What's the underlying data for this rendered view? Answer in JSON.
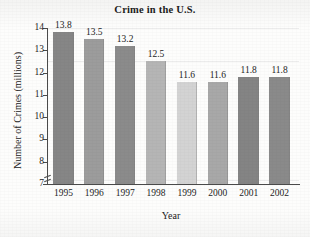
{
  "chart_data": {
    "type": "bar",
    "title": "Crime in the U.S.",
    "xlabel": "Year",
    "ylabel": "Number of Crimes (millions)",
    "categories": [
      "1995",
      "1996",
      "1997",
      "1998",
      "1999",
      "2000",
      "2001",
      "2002"
    ],
    "values": [
      13.8,
      13.5,
      13.2,
      12.5,
      11.6,
      11.6,
      11.8,
      11.8
    ],
    "value_labels": [
      "13.8",
      "13.5",
      "13.2",
      "12.5",
      "11.6",
      "11.6",
      "11.8",
      "11.8"
    ],
    "ylim": [
      7,
      14
    ],
    "yticks": [
      7,
      8,
      9,
      10,
      11,
      12,
      13,
      14
    ],
    "ytick_labels": [
      "7",
      "8",
      "9",
      "10",
      "11",
      "12",
      "13",
      "14"
    ],
    "axis_break": true,
    "grid": false,
    "legend": null,
    "bar_colors": [
      "#868686",
      "#9c9c9c",
      "#8b8b8b",
      "#b5b5b5",
      "#d3d3d3",
      "#a8a8a8",
      "#848484",
      "#8a8a8a"
    ]
  }
}
